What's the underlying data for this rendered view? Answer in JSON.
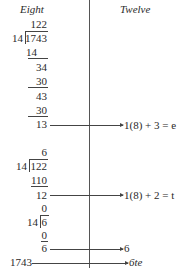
{
  "headers": {
    "left": "Eight",
    "right": "Twelve"
  },
  "division1": {
    "quotient": "122",
    "divisor": "14",
    "dividend": "1743",
    "steps": [
      "14",
      "34",
      "30",
      "43",
      "30"
    ],
    "remainder": "13",
    "result": "1(8) + 3 = e"
  },
  "division2": {
    "quotient": "6",
    "divisor": "14",
    "dividend": "122",
    "steps": [
      "110"
    ],
    "remainder": "12",
    "result": "1(8) + 2 = t"
  },
  "division3": {
    "quotient": "0",
    "divisor": "14",
    "dividend": "6",
    "steps": [
      "0"
    ],
    "remainder": "6",
    "result": "6"
  },
  "final": {
    "left": "1743",
    "right": "6te"
  }
}
